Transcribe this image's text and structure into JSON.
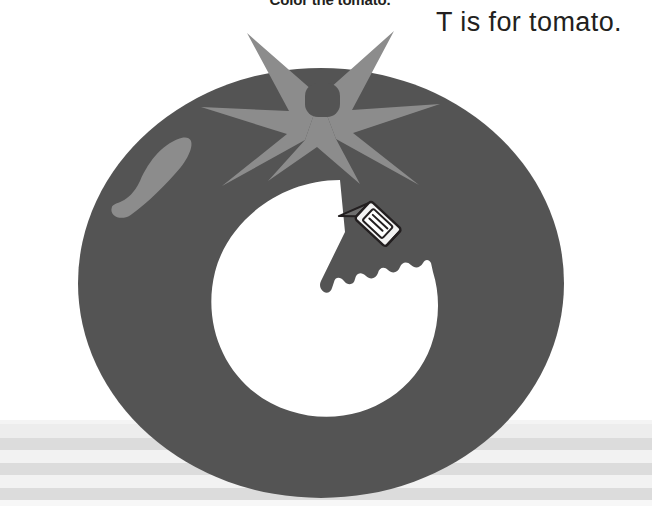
{
  "page": {
    "width": 660,
    "height": 522,
    "background_color": "#ffffff"
  },
  "instruction": {
    "text": "Color the tomato.",
    "color": "#231f20",
    "clipped": true
  },
  "phrase": {
    "text": "T is for tomato.",
    "color": "#231f20"
  },
  "illustration": {
    "name": "tomato-coloring-page",
    "subject": "tomato",
    "letter": "T",
    "colors": {
      "body": "#545454",
      "calyx": "#8c8c8c",
      "highlight": "#8c8c8c",
      "stem_nub": "#545454",
      "uncolored_area": "#ffffff",
      "crayon_body": "#f2f2f2",
      "crayon_outline": "#231f20",
      "crayon_tip": "#6e6e6e"
    },
    "parts": [
      {
        "name": "tomato-body",
        "shape": "ellipse"
      },
      {
        "name": "tomato-calyx-star",
        "shape": "six-point-star",
        "points": 6
      },
      {
        "name": "tomato-stem-nub",
        "shape": "rounded-square"
      },
      {
        "name": "tomato-highlight",
        "shape": "curved-stroke"
      },
      {
        "name": "uncolored-circle",
        "shape": "scalloped-circle"
      },
      {
        "name": "crayon",
        "shape": "crayon"
      }
    ]
  },
  "surface": {
    "name": "table-surface",
    "stripe_color": "#dcdcdc",
    "gap_color": "#f2f2f2",
    "stripes": [
      {
        "top": 2,
        "height": 4,
        "color": "#f4f4f4"
      },
      {
        "top": 6,
        "height": 14,
        "color": "#ededed"
      },
      {
        "top": 20,
        "height": 12,
        "color": "#dcdcdc"
      },
      {
        "top": 32,
        "height": 13,
        "color": "#f2f2f2"
      },
      {
        "top": 45,
        "height": 12,
        "color": "#dcdcdc"
      },
      {
        "top": 57,
        "height": 13,
        "color": "#f2f2f2"
      },
      {
        "top": 70,
        "height": 12,
        "color": "#dcdcdc"
      },
      {
        "top": 82,
        "height": 6,
        "color": "#f7f7f7"
      }
    ]
  }
}
